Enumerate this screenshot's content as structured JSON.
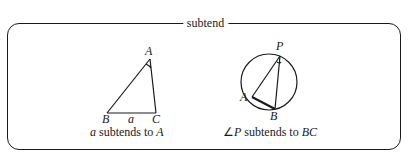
{
  "frame": {
    "title": "subtend"
  },
  "figures": [
    {
      "name": "triangle",
      "vertices": {
        "A": "A",
        "B": "B",
        "C": "C"
      },
      "side_label": "a",
      "caption": {
        "var": "a",
        "text": " subtends to ",
        "target": "A"
      }
    },
    {
      "name": "inscribed-angle",
      "points": {
        "P": "P",
        "A": "A",
        "B": "B"
      },
      "caption": {
        "prefix": "∠",
        "var": "P",
        "text": " subtends to ",
        "target": "BC"
      }
    }
  ]
}
